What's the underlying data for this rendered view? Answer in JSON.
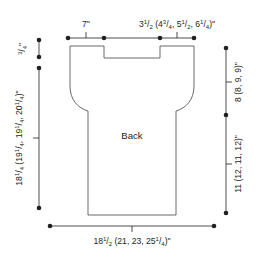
{
  "diagram": {
    "title": "Back",
    "piece_label": "Back",
    "units": "inches",
    "colors": {
      "outline": "#58595b",
      "dimension": "#231f20",
      "background": "#ffffff"
    },
    "dimensions": {
      "top_shoulder": {
        "name": "shoulder-width",
        "whole": "7",
        "unit": "\"",
        "full_text": "7\"",
        "position": "top-left"
      },
      "top_neck": {
        "name": "neck-width",
        "full_text": "3¹/₂ (4³/₄, 5¹/₂, 6¹/₄)\"",
        "base_whole": "3",
        "base_num": "1",
        "base_den": "2",
        "alt1_whole": "4",
        "alt1_num": "3",
        "alt1_den": "4",
        "alt2_whole": "5",
        "alt2_num": "1",
        "alt2_den": "2",
        "alt3_whole": "6",
        "alt3_num": "1",
        "alt3_den": "4",
        "unit": "\"",
        "position": "top-right"
      },
      "neck_depth": {
        "name": "neck-depth",
        "full_text": "³/₄\"",
        "num": "3",
        "den": "4",
        "unit": "\"",
        "position": "left-upper"
      },
      "total_length": {
        "name": "total-length",
        "full_text": "18¹/₄ (19¹/₄, 19¹/₄, 20¹/₄)\"",
        "base_whole": "18",
        "base_num": "1",
        "base_den": "4",
        "alt1_whole": "19",
        "alt1_num": "1",
        "alt1_den": "4",
        "alt2_whole": "19",
        "alt2_num": "1",
        "alt2_den": "4",
        "alt3_whole": "20",
        "alt3_num": "1",
        "alt3_den": "4",
        "unit": "\"",
        "position": "left"
      },
      "armhole_depth": {
        "name": "armhole-depth",
        "full_text": "8 (8, 9, 9)\"",
        "position": "right-upper"
      },
      "body_length": {
        "name": "body-length-to-underarm",
        "full_text": "11 (12, 11, 12)\"",
        "position": "right-lower"
      },
      "bottom_width": {
        "name": "bottom-width",
        "full_text": "18¹/₂ (21, 23, 25¹/₄)\"",
        "base_whole": "18",
        "base_num": "1",
        "base_den": "2",
        "alt1_whole": "21",
        "alt2_whole": "23",
        "alt3_whole": "25",
        "alt3_num": "1",
        "alt3_den": "4",
        "unit": "\"",
        "position": "bottom"
      }
    }
  }
}
